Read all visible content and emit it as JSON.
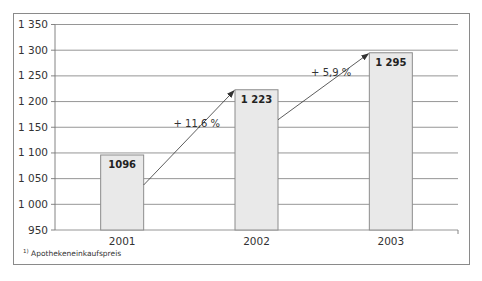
{
  "chart_data": {
    "type": "bar",
    "title": "",
    "xlabel": "",
    "ylabel": "",
    "categories": [
      "2001",
      "2002",
      "2003"
    ],
    "values": [
      1096,
      1223,
      1295
    ],
    "value_labels": [
      "1096",
      "1 223",
      "1 295"
    ],
    "ylim": [
      950,
      1350
    ],
    "yticks": [
      950,
      1000,
      1050,
      1100,
      1150,
      1200,
      1250,
      1300,
      1350
    ],
    "ytick_labels": [
      "950",
      "1 000",
      "1 050",
      "1 100",
      "1 150",
      "1 200",
      "1 250",
      "1 300",
      "1 350"
    ],
    "grid": true,
    "legend": null,
    "annotations": [
      {
        "from": "2001",
        "to": "2002",
        "text": "+ 11,6 %"
      },
      {
        "from": "2002",
        "to": "2003",
        "text": "+ 5,9 %"
      }
    ],
    "bar_color": "#e9e9e9",
    "bar_edge_color": "#8c8c8c"
  },
  "footnote": {
    "marker": "1)",
    "text": "Apothekeneinkaufspreis"
  }
}
